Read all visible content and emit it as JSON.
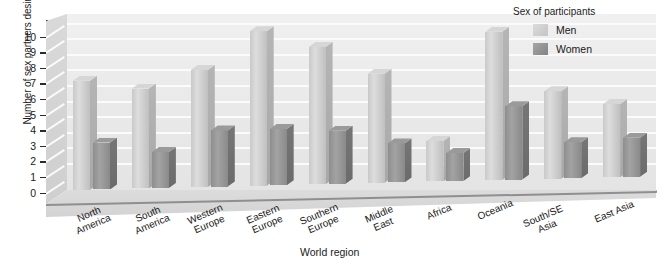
{
  "chart_data": {
    "type": "bar",
    "title": "",
    "subtitle": "",
    "xlabel": "World region",
    "ylabel": "Number of sex partners desired",
    "ylim": [
      0,
      10
    ],
    "yticks": [
      0,
      1,
      2,
      3,
      4,
      5,
      6,
      7,
      8,
      9,
      10
    ],
    "grid": true,
    "legend_position": "top-right",
    "legend_title": "Sex of participants",
    "categories": [
      "North\nAmerica",
      "South\nAmerica",
      "Western\nEurope",
      "Eastern\nEurope",
      "Southern\nEurope",
      "Middle\nEast",
      "Africa",
      "Oceania",
      "South/SE Asia",
      "East Asia"
    ],
    "series": [
      {
        "name": "Men",
        "color": "#d6d6d6",
        "values": [
          7.0,
          6.4,
          7.5,
          9.9,
          8.8,
          7.0,
          2.6,
          9.5,
          5.6,
          4.7
        ]
      },
      {
        "name": "Women",
        "color": "#8e8e8e",
        "values": [
          3.0,
          2.3,
          3.6,
          3.6,
          3.4,
          2.5,
          1.8,
          4.7,
          2.3,
          2.5
        ]
      }
    ],
    "annotations": []
  },
  "axis": {
    "y_label": "Number of sex partners desired",
    "x_label": "World region",
    "y_tick_labels": [
      "10",
      "9",
      "8",
      "7",
      "6",
      "5",
      "4",
      "3",
      "2",
      "1",
      "0"
    ]
  },
  "legend": {
    "title": "Sex of participants",
    "entries": [
      {
        "label": "Men",
        "swatch": "#d6d6d6"
      },
      {
        "label": "Women",
        "swatch": "#8e8e8e"
      }
    ]
  },
  "style": {
    "plot_background": "#eaeaea",
    "floor": "#d6d6d6",
    "gridline": "#fbfbfb",
    "axis": "#2b2b2b"
  }
}
